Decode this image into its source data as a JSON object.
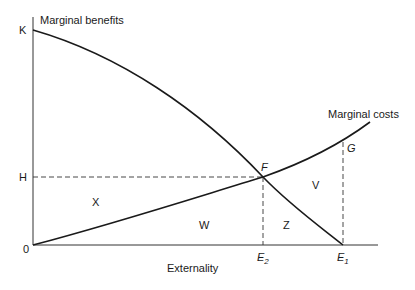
{
  "diagram": {
    "type": "economics-externality",
    "x_axis_label": "Externality",
    "y_axis_labels": {
      "top": "K",
      "mid": "H",
      "origin": "0"
    },
    "curves": [
      {
        "name": "Marginal benefits",
        "shape": "concave, declining from K to E1"
      },
      {
        "name": "Marginal costs",
        "shape": "convex, rising from origin"
      }
    ],
    "points": {
      "F": "F",
      "G": "G",
      "E2_main": "E",
      "E2_sub": "2",
      "E1_main": "E",
      "E1_sub": "1"
    },
    "regions": {
      "X": "X",
      "W": "W",
      "Z": "Z",
      "V": "V"
    }
  }
}
